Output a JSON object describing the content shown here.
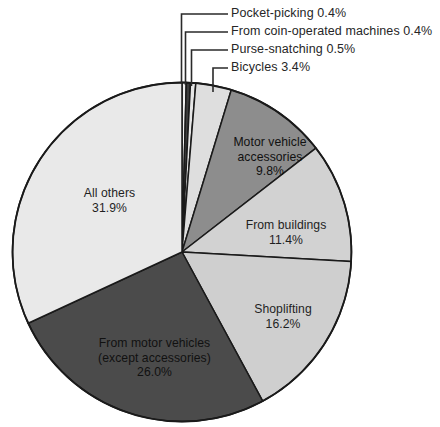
{
  "chart_data": {
    "type": "pie",
    "title": "",
    "subtitle": "",
    "xlabel": "",
    "ylabel": "",
    "legend_position": "none",
    "grid": false,
    "units": "percent",
    "start_angle_deg": 0,
    "direction": "clockwise",
    "categories": [
      "Pocket-picking",
      "From coin-operated machines",
      "Purse-snatching",
      "Bicycles",
      "Motor vehicle accessories",
      "From buildings",
      "Shoplifting",
      "From motor vehicles (except accessories)",
      "All others"
    ],
    "values": [
      0.4,
      0.4,
      0.5,
      3.4,
      9.8,
      11.4,
      16.2,
      26.0,
      31.9
    ],
    "slices": [
      {
        "key": "pocket-picking",
        "label": "Pocket-picking",
        "value": 0.4,
        "value_text": "0.4%",
        "full_text": "Pocket-picking 0.4%",
        "color": "#efefef",
        "label_placement": "callout"
      },
      {
        "key": "coin-operated-machines",
        "label": "From coin-operated machines",
        "value": 0.4,
        "value_text": "0.4%",
        "full_text": "From coin-operated machines 0.4%",
        "color": "#3d3d3d",
        "label_placement": "callout"
      },
      {
        "key": "purse-snatching",
        "label": "Purse-snatching",
        "value": 0.5,
        "value_text": "0.5%",
        "full_text": "Purse-snatching 0.5%",
        "color": "#e6e6e6",
        "label_placement": "callout"
      },
      {
        "key": "bicycles",
        "label": "Bicycles",
        "value": 3.4,
        "value_text": "3.4%",
        "full_text": "Bicycles 3.4%",
        "color": "#dedede",
        "label_placement": "callout"
      },
      {
        "key": "motor-vehicle-accessories",
        "label": "Motor vehicle accessories",
        "value": 9.8,
        "value_text": "9.8%",
        "label_line_1": "Motor vehicle",
        "label_line_2": "accessories",
        "color": "#8d8d8d",
        "label_placement": "inside"
      },
      {
        "key": "from-buildings",
        "label": "From buildings",
        "value": 11.4,
        "value_text": "11.4%",
        "label_line_1": "From buildings",
        "color": "#d2d2d2",
        "label_placement": "inside"
      },
      {
        "key": "shoplifting",
        "label": "Shoplifting",
        "value": 16.2,
        "value_text": "16.2%",
        "label_line_1": "Shoplifting",
        "color": "#cfcfcf",
        "label_placement": "inside"
      },
      {
        "key": "from-motor-vehicles",
        "label": "From motor vehicles (except accessories)",
        "value": 26.0,
        "value_text": "26.0%",
        "label_line_1": "From motor vehicles",
        "label_line_2": "(except accessories)",
        "color": "#4b4b4b",
        "label_placement": "inside"
      },
      {
        "key": "all-others",
        "label": "All others",
        "value": 31.9,
        "value_text": "31.9%",
        "label_line_1": "All others",
        "color": "#e9e9e9",
        "label_placement": "inside"
      }
    ],
    "callouts": [
      {
        "key": "pocket-picking",
        "text": "Pocket-picking 0.4%"
      },
      {
        "key": "coin-operated-machines",
        "text": "From coin-operated machines 0.4%"
      },
      {
        "key": "purse-snatching",
        "text": "Purse-snatching 0.5%"
      },
      {
        "key": "bicycles",
        "text": "Bicycles 3.4%"
      }
    ],
    "colors": {
      "outline": "#1a1a1a",
      "background": "#ffffff",
      "text": "#262626",
      "leader_line": "#2a2a2a"
    }
  }
}
